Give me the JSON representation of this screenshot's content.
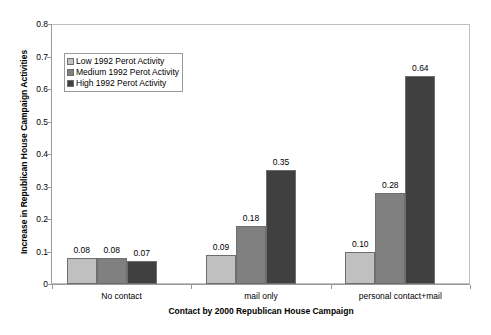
{
  "chart_data": {
    "type": "bar",
    "title": "",
    "xlabel": "Contact by 2000 Republican House Campaign",
    "ylabel": "Increase in Republican House Campaign Activities",
    "categories": [
      "No contact",
      "mail only",
      "personal contact+mail"
    ],
    "series": [
      {
        "name": "Low 1992 Perot Activity",
        "color": "#c0c0c0",
        "values": [
          0.08,
          0.09,
          0.1
        ],
        "labels": [
          "0.08",
          "0.09",
          "0.10"
        ]
      },
      {
        "name": "Medium 1992 Perot Activity",
        "color": "#808080",
        "values": [
          0.08,
          0.18,
          0.28
        ],
        "labels": [
          "0.08",
          "0.18",
          "0.28"
        ]
      },
      {
        "name": "High 1992 Perot Activity",
        "color": "#404040",
        "values": [
          0.07,
          0.35,
          0.64
        ],
        "labels": [
          "0.07",
          "0.35",
          "0.64"
        ]
      }
    ],
    "ylim": [
      0,
      0.8
    ],
    "ytick_values": [
      0,
      0.1,
      0.2,
      0.3,
      0.4,
      0.5,
      0.6,
      0.7,
      0.8
    ],
    "ytick_labels": [
      "0",
      "0.1",
      "0.2",
      "0.3",
      "0.4",
      "0.5",
      "0.6",
      "0.7",
      "0.8"
    ],
    "grid": false,
    "legend_position": "upper-left-inside",
    "show_value_labels": true,
    "plot_background": "#ffffff",
    "border_color": "#bfbfbf"
  }
}
